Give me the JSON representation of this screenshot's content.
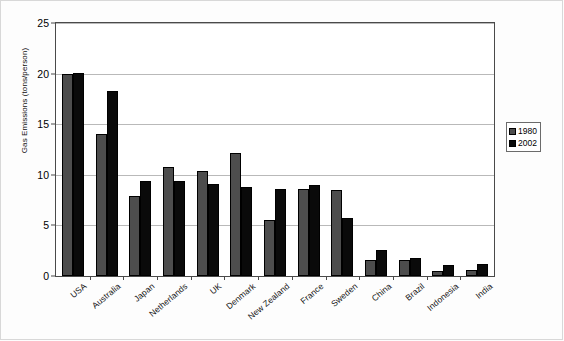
{
  "chart_data": {
    "type": "bar",
    "title": "",
    "subtitle": "",
    "xlabel": "",
    "ylabel": "Gas Emissions (tons/person)",
    "ylim": [
      0,
      25
    ],
    "yticks": [
      0,
      5,
      10,
      15,
      20,
      25
    ],
    "grid": true,
    "legend_position": "right",
    "categories": [
      "USA",
      "Australia",
      "Japan",
      "Netherlands",
      "UK",
      "Denmark",
      "New Zealand",
      "France",
      "Sweden",
      "China",
      "Brazil",
      "Indonesia",
      "India"
    ],
    "series": [
      {
        "name": "1980",
        "color": "#4d4d4d",
        "values": [
          20.0,
          14.0,
          7.9,
          10.8,
          10.4,
          12.2,
          5.5,
          8.6,
          8.5,
          1.6,
          1.6,
          0.5,
          0.6
        ]
      },
      {
        "name": "2002",
        "color": "#0a0a0a",
        "values": [
          20.1,
          18.3,
          9.4,
          9.4,
          9.1,
          8.8,
          8.6,
          9.0,
          5.7,
          2.6,
          1.8,
          1.1,
          1.2
        ]
      }
    ]
  },
  "legend": {
    "entries": [
      {
        "label": "1980",
        "color": "#4d4d4d"
      },
      {
        "label": "2002",
        "color": "#0a0a0a"
      }
    ]
  }
}
